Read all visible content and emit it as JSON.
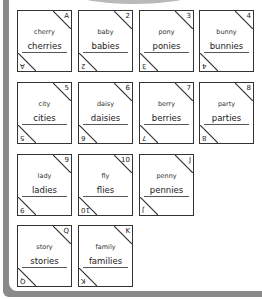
{
  "worksheet": {
    "cards": [
      {
        "singular": "cherry",
        "plural": "cherries",
        "label": "A"
      },
      {
        "singular": "baby",
        "plural": "babies",
        "label": "2"
      },
      {
        "singular": "pony",
        "plural": "ponies",
        "label": "3"
      },
      {
        "singular": "bunny",
        "plural": "bunnies",
        "label": "4"
      },
      {
        "singular": "city",
        "plural": "cities",
        "label": "5"
      },
      {
        "singular": "daisy",
        "plural": "daisies",
        "label": "6"
      },
      {
        "singular": "berry",
        "plural": "berries",
        "label": "7"
      },
      {
        "singular": "party",
        "plural": "parties",
        "label": "8"
      },
      {
        "singular": "lady",
        "plural": "ladies",
        "label": "9"
      },
      {
        "singular": "fly",
        "plural": "flies",
        "label": "10"
      },
      {
        "singular": "penny",
        "plural": "pennies",
        "label": "J"
      },
      {
        "singular": "story",
        "plural": "stories",
        "label": "Q"
      },
      {
        "singular": "family",
        "plural": "families",
        "label": "K"
      }
    ]
  },
  "colors": {
    "frame": "#8a8a8a",
    "tab": "#b9b9b9",
    "card_border": "#333333"
  }
}
